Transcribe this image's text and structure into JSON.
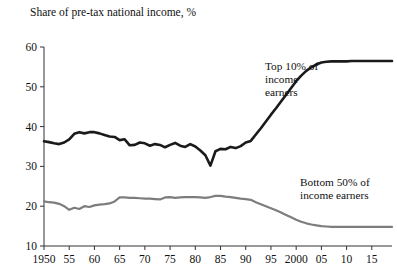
{
  "chart_data": {
    "type": "line",
    "title": "Share of pre-tax national income, %",
    "xlabel": "",
    "ylabel": "Share of pre-tax national income, %",
    "xlim": [
      1950,
      2019
    ],
    "ylim": [
      10,
      60
    ],
    "yticks": [
      10,
      20,
      30,
      40,
      50,
      60
    ],
    "ytick_labels": [
      "10",
      "20",
      "30",
      "40",
      "50",
      "60"
    ],
    "xticks": [
      1950,
      1955,
      1960,
      1965,
      1970,
      1975,
      1980,
      1985,
      1990,
      1995,
      2000,
      2005,
      2010,
      2015
    ],
    "xtick_labels": [
      "1950",
      "55",
      "60",
      "65",
      "70",
      "75",
      "80",
      "85",
      "90",
      "95",
      "2000",
      "05",
      "10",
      "15"
    ],
    "grid": false,
    "legend_position": "inline-annotation",
    "series": [
      {
        "name": "Top 10% of income earners",
        "color": "#1a1a1a",
        "annotation": "Top 10% of\nincome\nearners",
        "x": [
          1950,
          1951,
          1952,
          1953,
          1954,
          1955,
          1956,
          1957,
          1958,
          1959,
          1960,
          1961,
          1962,
          1963,
          1964,
          1965,
          1966,
          1967,
          1968,
          1969,
          1970,
          1971,
          1972,
          1973,
          1974,
          1975,
          1976,
          1977,
          1978,
          1979,
          1980,
          1981,
          1982,
          1983,
          1984,
          1985,
          1986,
          1987,
          1988,
          1989,
          1990,
          1991,
          1992,
          1993,
          1994,
          1995,
          1996,
          1997,
          1998,
          1999,
          2000,
          2001,
          2002,
          2003,
          2004,
          2005,
          2006,
          2007,
          2008,
          2009,
          2010,
          2011,
          2012,
          2013,
          2014,
          2015,
          2016,
          2017,
          2018,
          2019
        ],
        "y": [
          36.3,
          36.1,
          35.8,
          35.6,
          36.0,
          36.8,
          38.2,
          38.6,
          38.3,
          38.6,
          38.6,
          38.3,
          37.9,
          37.5,
          37.4,
          36.6,
          36.8,
          35.3,
          35.4,
          36.0,
          35.8,
          35.2,
          35.6,
          35.4,
          34.8,
          35.4,
          35.9,
          35.2,
          34.9,
          35.6,
          35.0,
          34.0,
          32.8,
          30.2,
          33.8,
          34.4,
          34.3,
          34.9,
          34.6,
          35.1,
          36.0,
          36.4,
          38.0,
          39.6,
          41.3,
          43.0,
          44.6,
          46.3,
          48.0,
          49.7,
          51.4,
          52.8,
          54.0,
          54.9,
          55.6,
          56.1,
          56.3,
          56.4,
          56.4,
          56.4,
          56.4,
          56.5,
          56.5,
          56.5,
          56.5,
          56.5,
          56.5,
          56.5,
          56.5,
          56.5
        ]
      },
      {
        "name": "Bottom 50% of income earners",
        "color": "#7d7d7d",
        "annotation": "Bottom 50% of\nincome earners",
        "x": [
          1950,
          1951,
          1952,
          1953,
          1954,
          1955,
          1956,
          1957,
          1958,
          1959,
          1960,
          1961,
          1962,
          1963,
          1964,
          1965,
          1966,
          1967,
          1968,
          1969,
          1970,
          1971,
          1972,
          1973,
          1974,
          1975,
          1976,
          1977,
          1978,
          1979,
          1980,
          1981,
          1982,
          1983,
          1984,
          1985,
          1986,
          1987,
          1988,
          1989,
          1990,
          1991,
          1992,
          1993,
          1994,
          1995,
          1996,
          1997,
          1998,
          1999,
          2000,
          2001,
          2002,
          2003,
          2004,
          2005,
          2006,
          2007,
          2008,
          2009,
          2010,
          2011,
          2012,
          2013,
          2014,
          2015,
          2016,
          2017,
          2018,
          2019
        ],
        "y": [
          21.2,
          21.0,
          20.9,
          20.6,
          20.0,
          19.1,
          19.6,
          19.3,
          20.0,
          19.8,
          20.2,
          20.4,
          20.5,
          20.7,
          21.2,
          22.2,
          22.2,
          22.1,
          22.1,
          22.0,
          21.9,
          21.9,
          21.8,
          21.7,
          22.2,
          22.3,
          22.1,
          22.2,
          22.3,
          22.3,
          22.3,
          22.2,
          22.1,
          22.3,
          22.6,
          22.6,
          22.4,
          22.3,
          22.1,
          21.9,
          21.8,
          21.6,
          21.0,
          20.5,
          20.0,
          19.5,
          19.0,
          18.4,
          17.8,
          17.2,
          16.6,
          16.1,
          15.7,
          15.4,
          15.2,
          15.0,
          14.9,
          14.8,
          14.8,
          14.8,
          14.8,
          14.8,
          14.8,
          14.8,
          14.8,
          14.8,
          14.8,
          14.8,
          14.8,
          14.8
        ]
      }
    ]
  }
}
